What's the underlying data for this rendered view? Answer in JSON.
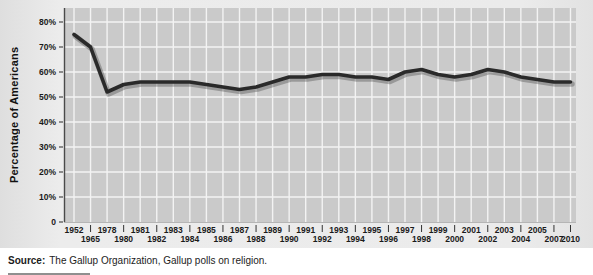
{
  "figure": {
    "y_axis_title": "Percentage of Americans",
    "source": {
      "label": "Source:",
      "text": "The Gallup Organization, Gallup polls on religion."
    }
  },
  "chart_data": {
    "type": "line",
    "title": "",
    "xlabel": "",
    "ylabel": "Percentage of Americans",
    "categories": [
      "1952",
      "1965",
      "1978",
      "1980",
      "1981",
      "1982",
      "1983",
      "1984",
      "1985",
      "1986",
      "1987",
      "1988",
      "1989",
      "1990",
      "1991",
      "1992",
      "1993",
      "1994",
      "1995",
      "1996",
      "1997",
      "1998",
      "1999",
      "2000",
      "2001",
      "2002",
      "2003",
      "2004",
      "2005",
      "2007",
      "2010"
    ],
    "values": [
      75,
      70,
      52,
      55,
      56,
      56,
      56,
      56,
      55,
      54,
      53,
      54,
      56,
      58,
      58,
      59,
      59,
      58,
      58,
      57,
      60,
      61,
      59,
      58,
      59,
      61,
      60,
      58,
      57,
      56,
      56
    ],
    "label_rows": [
      "top",
      "bottom",
      "top",
      "bottom",
      "top",
      "bottom",
      "top",
      "bottom",
      "top",
      "bottom",
      "top",
      "bottom",
      "top",
      "bottom",
      "top",
      "bottom",
      "top",
      "bottom",
      "top",
      "bottom",
      "top",
      "bottom",
      "top",
      "bottom",
      "top",
      "bottom",
      "top",
      "bottom",
      "top",
      "bottom",
      "bottom"
    ],
    "ylim": [
      0,
      80
    ],
    "ytick_values": [
      0,
      10,
      20,
      30,
      40,
      50,
      60,
      70,
      80
    ],
    "ytick_labels": [
      "0",
      "10%",
      "20%",
      "30%",
      "40%",
      "50%",
      "60%",
      "70%",
      "80%"
    ],
    "grid": true,
    "legend": "none",
    "colors": {
      "line": "#2a2a2a",
      "line_shadow": "rgba(80,80,80,0.40)",
      "plot_bg": "#cacaca",
      "grid": "#f3f3f3",
      "axis": "#4a4a4a",
      "tick_text": "#1a1a1a"
    }
  }
}
